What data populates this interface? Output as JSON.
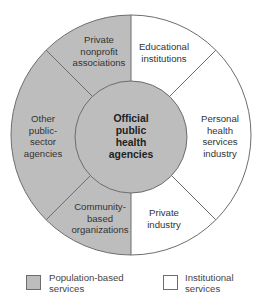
{
  "diagram": {
    "center": {
      "label_lines": [
        "Official",
        "public",
        "health",
        "agencies"
      ],
      "fill": "#bdbdbd"
    },
    "segments": [
      {
        "id": "private-nonprofit",
        "label_lines": [
          "Private",
          "nonprofit",
          "associations"
        ],
        "category": "population",
        "fill": "#bdbdbd"
      },
      {
        "id": "educational",
        "label_lines": [
          "Educational",
          "institutions"
        ],
        "category": "institutional",
        "fill": "#ffffff"
      },
      {
        "id": "personal-health",
        "label_lines": [
          "Personal",
          "health",
          "services",
          "industry"
        ],
        "category": "institutional",
        "fill": "#ffffff"
      },
      {
        "id": "private-industry",
        "label_lines": [
          "Private",
          "industry"
        ],
        "category": "institutional",
        "fill": "#ffffff"
      },
      {
        "id": "community-based",
        "label_lines": [
          "Community-",
          "based",
          "organizations"
        ],
        "category": "population",
        "fill": "#bdbdbd"
      },
      {
        "id": "other-public",
        "label_lines": [
          "Other",
          "public-",
          "sector",
          "agencies"
        ],
        "category": "population",
        "fill": "#bdbdbd"
      }
    ]
  },
  "legend": [
    {
      "label_lines": [
        "Population-based",
        "services"
      ],
      "fill": "#bdbdbd"
    },
    {
      "label_lines": [
        "Institutional",
        "services"
      ],
      "fill": "#ffffff"
    }
  ],
  "colors": {
    "population": "#bdbdbd",
    "institutional": "#ffffff",
    "stroke": "#6d6d6d"
  }
}
